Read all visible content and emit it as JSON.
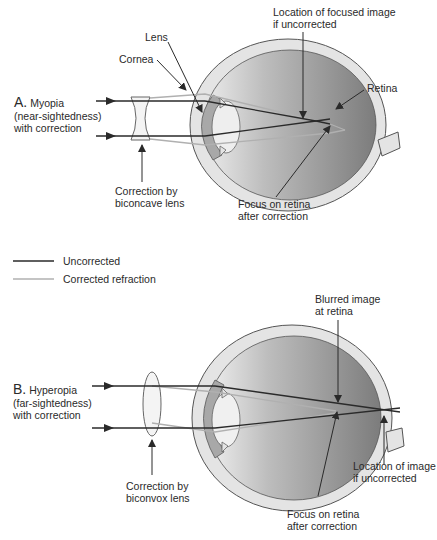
{
  "panel_a": {
    "title_letter": "A.",
    "title_line1": "Myopia",
    "title_line2": "(near-sightedness)",
    "title_line3": "with correction",
    "labels": {
      "lens": "Lens",
      "cornea": "Cornea",
      "focused_image_line1": "Location of focused image",
      "focused_image_line2": "if uncorrected",
      "retina": "Retina",
      "correction_line1": "Correction by",
      "correction_line2": "biconcave lens",
      "focus_line1": "Focus on retina",
      "focus_line2": "after correction"
    }
  },
  "legend": {
    "items": [
      {
        "label": "Uncorrected",
        "color": "#2a2a2a"
      },
      {
        "label": "Corrected refraction",
        "color": "#b0b0b0"
      }
    ]
  },
  "panel_b": {
    "title_letter": "B.",
    "title_line1": "Hyperopia",
    "title_line2": "(far-sightedness)",
    "title_line3": "with correction",
    "labels": {
      "blurred_line1": "Blurred image",
      "blurred_line2": "at retina",
      "correction_line1": "Correction by",
      "correction_line2": "biconvox lens",
      "location_line1": "Location of image",
      "location_line2": "if uncorrected",
      "focus_line1": "Focus on retina",
      "focus_line2": "after correction"
    }
  },
  "colors": {
    "ink": "#2a2a2a",
    "corrected_ray": "#b0b0b0",
    "sclera": "#e2e2e2",
    "cornea": "#a8a8a8",
    "vitreous_dark": "#7a7a7a",
    "vitreous_light": "#e8e8e8"
  }
}
